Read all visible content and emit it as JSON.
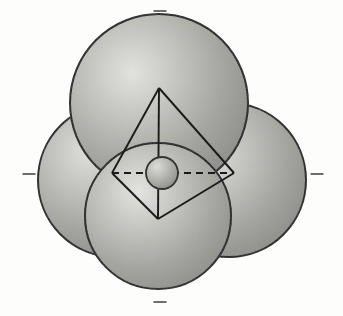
{
  "figure": {
    "title": "Tetrahedral coordination polyhedron",
    "background_color": "#fdfdfc",
    "stroke_color": "#1a1a1a",
    "sphere_fill_light": "#d9d9d6",
    "sphere_fill_mid": "#a8a8a4",
    "sphere_fill_dark": "#8d8d89",
    "width": 343,
    "height": 316
  },
  "spheres": {
    "large_label": "coordinating sphere",
    "center_label": "central atom sphere",
    "items": [
      {
        "name": "sphere-top",
        "cx": 159,
        "cy": 103,
        "r": 89,
        "highlight_dx": -0.3,
        "highlight_dy": -0.32
      },
      {
        "name": "sphere-left",
        "cx": 115,
        "cy": 180,
        "r": 77,
        "highlight_dx": -0.32,
        "highlight_dy": -0.34
      },
      {
        "name": "sphere-right",
        "cx": 229,
        "cy": 180,
        "r": 77,
        "highlight_dx": -0.3,
        "highlight_dy": -0.3
      },
      {
        "name": "sphere-bottom",
        "cx": 158,
        "cy": 216,
        "r": 73,
        "highlight_dx": -0.28,
        "highlight_dy": -0.3
      }
    ],
    "center": {
      "name": "sphere-center",
      "cx": 162,
      "cy": 173,
      "r": 16,
      "highlight_dx": -0.3,
      "highlight_dy": -0.34
    }
  },
  "polyhedron": {
    "label": "tetrahedron wireframe",
    "vertices": {
      "top": {
        "x": 159,
        "y": 88
      },
      "left": {
        "x": 112,
        "y": 173
      },
      "right": {
        "x": 234,
        "y": 173
      },
      "bottom": {
        "x": 158,
        "y": 219
      }
    },
    "solid_edges": [
      [
        "top",
        "left"
      ],
      [
        "top",
        "right"
      ],
      [
        "top",
        "bottom"
      ],
      [
        "left",
        "bottom"
      ],
      [
        "right",
        "bottom"
      ]
    ],
    "dashed_edges": [
      [
        "left",
        "right"
      ]
    ],
    "dash_pattern": "7 5",
    "stroke_width": 1.9
  },
  "ticks": {
    "label": "axis tick mark",
    "color": "#6e6e6e",
    "items": [
      {
        "name": "tick-top",
        "x": 160,
        "y": 11,
        "w": 13,
        "h": 2
      },
      {
        "name": "tick-bottom",
        "x": 160,
        "y": 302,
        "w": 13,
        "h": 2
      },
      {
        "name": "tick-left",
        "x": 29,
        "y": 174,
        "w": 13,
        "h": 2
      },
      {
        "name": "tick-right",
        "x": 317,
        "y": 174,
        "w": 13,
        "h": 2
      }
    ]
  },
  "bleed_through_text": [
    {
      "text": "mode",
      "x": 38,
      "y": 104,
      "size": 17
    },
    {
      "text": "sich",
      "x": 232,
      "y": 100,
      "size": 17
    },
    {
      "text": "ersch",
      "x": 30,
      "y": 132,
      "size": 16
    },
    {
      "text": "tion",
      "x": 246,
      "y": 130,
      "size": 16
    },
    {
      "text": "Ein",
      "x": 30,
      "y": 232,
      "size": 17
    },
    {
      "text": "aller",
      "x": 248,
      "y": 228,
      "size": 16
    },
    {
      "text": "von He",
      "x": 28,
      "y": 268,
      "size": 19
    },
    {
      "text": "det",
      "x": 262,
      "y": 266,
      "size": 17
    }
  ],
  "chart_data": {
    "type": "scatter",
    "title": "Tetrahedral coordination polyhedron",
    "xlabel": "",
    "ylabel": "",
    "categories": [
      "sphere-top",
      "sphere-left",
      "sphere-right",
      "sphere-bottom",
      "sphere-center"
    ],
    "values": [
      89,
      77,
      77,
      73,
      16
    ],
    "series": [
      {
        "name": "sphere radius (px)",
        "values": [
          89,
          77,
          77,
          73,
          16
        ]
      },
      {
        "name": "center x (px)",
        "values": [
          159,
          115,
          229,
          158,
          162
        ]
      },
      {
        "name": "center y (px)",
        "values": [
          103,
          180,
          180,
          216,
          173
        ]
      }
    ],
    "annotations": [
      "four large spheres arranged tetrahedrally",
      "small central sphere at polyhedron centroid",
      "solid tetrahedron edges drawn in black",
      "one dashed horizontal edge (rear edge) through center",
      "four tick marks at top, bottom, left and right page margins"
    ],
    "xlim": [
      0,
      343
    ],
    "ylim": [
      0,
      316
    ],
    "grid": false,
    "legend": "none"
  }
}
